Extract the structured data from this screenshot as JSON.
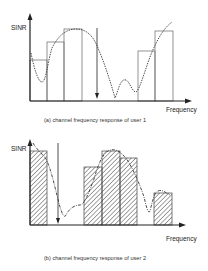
{
  "figure": {
    "panel_a": {
      "y_axis_label": "SINR",
      "x_axis_label": "Frequency",
      "caption": "(a) channel frequency response of user 1",
      "bars": [
        {
          "x": 30,
          "w": 17,
          "top": 60,
          "hatched": false
        },
        {
          "x": 47,
          "w": 17,
          "top": 42,
          "hatched": false
        },
        {
          "x": 64,
          "w": 18,
          "top": 29,
          "hatched": false
        },
        {
          "x": 138,
          "w": 17,
          "top": 51,
          "hatched": false
        },
        {
          "x": 155,
          "w": 18,
          "top": 31,
          "hatched": false
        }
      ],
      "threshold_arrow": {
        "x": 97,
        "from": 28,
        "to": 98
      }
    },
    "panel_b": {
      "y_axis_label": "SINR",
      "x_axis_label": "Frequency",
      "caption": "(b) channel frequency response of user 2",
      "bars": [
        {
          "x": 30,
          "w": 17,
          "top": 16,
          "hatched": true
        },
        {
          "x": 84,
          "w": 18,
          "top": 32,
          "hatched": true
        },
        {
          "x": 102,
          "w": 18,
          "top": 16,
          "hatched": true
        },
        {
          "x": 120,
          "w": 17,
          "top": 23,
          "hatched": true
        },
        {
          "x": 154,
          "w": 18,
          "top": 58,
          "hatched": true
        }
      ],
      "threshold_arrow": {
        "x": 58,
        "from": 8,
        "to": 89
      }
    },
    "colors": {
      "line": "#222222",
      "bar_stroke": "#555555",
      "hatch": "#333333",
      "background": "#ffffff"
    }
  }
}
